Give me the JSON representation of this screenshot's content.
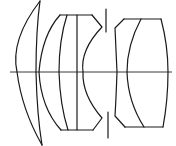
{
  "diagram": {
    "type": "optical-lens-cross-section",
    "colors": {
      "line": "#1a1a1a",
      "background": "#ffffff"
    },
    "elements": [
      {
        "name": "front-meniscus-element"
      },
      {
        "name": "cemented-group-2"
      },
      {
        "name": "aperture-stop"
      },
      {
        "name": "rear-cemented-group"
      }
    ],
    "optical_axis": {
      "y": 72,
      "x_start": 10,
      "x_end": 172
    }
  }
}
